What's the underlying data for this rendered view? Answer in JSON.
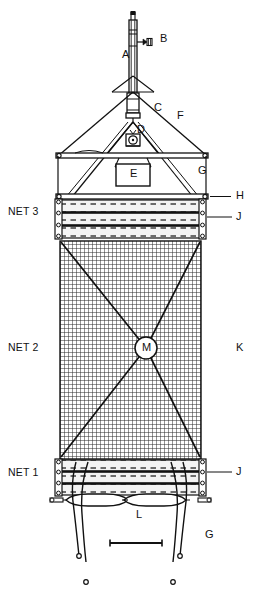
{
  "figure": {
    "type": "technical-line-diagram",
    "width_px": 256,
    "height_px": 610,
    "background_color": "#ffffff",
    "line_color": "#111111"
  },
  "labels": {
    "A": "A",
    "B": "B",
    "C": "C",
    "D": "D",
    "E": "E",
    "F": "F",
    "G_upper": "G",
    "G_lower": "G",
    "H": "H",
    "J_upper": "J",
    "J_lower": "J",
    "K": "K",
    "L": "L",
    "M": "M",
    "net3": "NET 3",
    "net2": "NET 2",
    "net1": "NET 1"
  },
  "components": [
    {
      "key": "A",
      "label": "A",
      "name": "mast-pole",
      "x": 128,
      "y": 55
    },
    {
      "key": "B",
      "label": "B",
      "name": "mast-fitting",
      "x": 163,
      "y": 38
    },
    {
      "key": "C",
      "label": "C",
      "name": "upper-coupling",
      "x": 159,
      "y": 108
    },
    {
      "key": "D",
      "label": "D",
      "name": "pulley-block",
      "x": 141,
      "y": 133
    },
    {
      "key": "E",
      "label": "E",
      "name": "instrument-housing",
      "x": 143,
      "y": 172
    },
    {
      "key": "F",
      "label": "F",
      "name": "upper-bridle-line",
      "x": 180,
      "y": 116
    },
    {
      "key": "G_upper",
      "label": "G",
      "name": "side-bridle-line",
      "x": 201,
      "y": 171
    },
    {
      "key": "H",
      "label": "H",
      "name": "upper-frame-bar",
      "x": 240,
      "y": 196
    },
    {
      "key": "J_upper",
      "label": "J",
      "name": "net-bar-upper",
      "x": 240,
      "y": 217
    },
    {
      "key": "K",
      "label": "K",
      "name": "side-frame-member",
      "x": 240,
      "y": 348
    },
    {
      "key": "J_lower",
      "label": "J",
      "name": "net-bar-lower",
      "x": 240,
      "y": 472
    },
    {
      "key": "G_lower",
      "label": "G",
      "name": "tow-cable",
      "x": 208,
      "y": 535
    },
    {
      "key": "L",
      "label": "L",
      "name": "lower-weight-bar",
      "x": 140,
      "y": 512
    },
    {
      "key": "M",
      "label": "M",
      "name": "center-node",
      "x": 146,
      "y": 348
    }
  ],
  "net_sections": [
    {
      "id": "net3",
      "label": "NET 3",
      "label_x": 8,
      "label_y": 207,
      "top": 199,
      "bottom": 241,
      "pattern": "dashed-bands"
    },
    {
      "id": "net2",
      "label": "NET 2",
      "label_x": 8,
      "label_y": 343,
      "top": 242,
      "bottom": 458,
      "pattern": "fine-mesh-grid"
    },
    {
      "id": "net1",
      "label": "NET 1",
      "label_x": 8,
      "label_y": 473,
      "top": 459,
      "bottom": 492,
      "pattern": "dashed-bands"
    }
  ],
  "scale_bar": {
    "present": true,
    "x1": 110,
    "x2": 160,
    "y": 543,
    "caption": ""
  },
  "cables": {
    "count": 4,
    "terminal_marker": "small-open-circle"
  }
}
